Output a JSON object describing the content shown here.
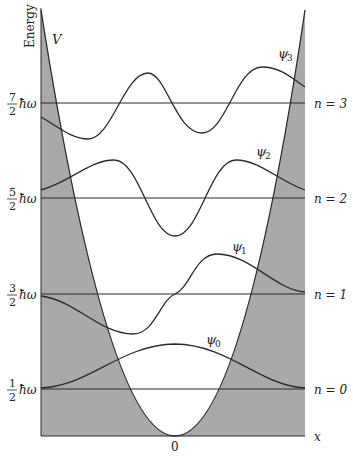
{
  "diagram": {
    "y_axis_label": "Energy",
    "x_axis_label": "x",
    "origin_label": "0",
    "potential_label": "V",
    "colors": {
      "forbidden_region": "#a9a9a9",
      "lines": "#2a2a2a",
      "background": "#ffffff"
    },
    "levels": [
      {
        "n": 0,
        "energy_num": "1",
        "energy_den": "2",
        "energy_unit": "ħω",
        "level_label": "n = 0",
        "psi_label": "ψ",
        "psi_sub": "0"
      },
      {
        "n": 1,
        "energy_num": "3",
        "energy_den": "2",
        "energy_unit": "ħω",
        "level_label": "n = 1",
        "psi_label": "ψ",
        "psi_sub": "1"
      },
      {
        "n": 2,
        "energy_num": "5",
        "energy_den": "2",
        "energy_unit": "ħω",
        "level_label": "n = 2",
        "psi_label": "ψ",
        "psi_sub": "2"
      },
      {
        "n": 3,
        "energy_num": "7",
        "energy_den": "2",
        "energy_unit": "ħω",
        "level_label": "n = 3",
        "psi_label": "ψ",
        "psi_sub": "3"
      }
    ]
  }
}
